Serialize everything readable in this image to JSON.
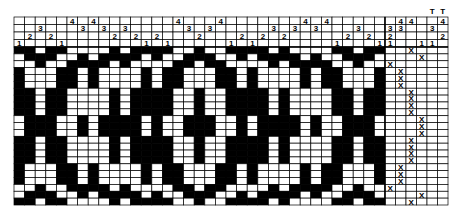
{
  "draft": {
    "title": "Weaving draft",
    "threading": [
      1,
      2,
      3,
      2,
      1,
      4,
      3,
      4,
      3,
      2,
      3,
      2,
      1,
      2,
      1,
      4,
      3,
      2,
      3,
      4,
      1,
      2,
      1,
      2,
      3,
      2,
      3,
      4,
      3,
      4,
      1,
      2,
      3,
      2,
      1
    ],
    "tieup_columns": [
      {
        "shafts": [
          1,
          2,
          3
        ],
        "label": ""
      },
      {
        "shafts": [
          3,
          4
        ],
        "label": ""
      },
      {
        "shafts": [
          4
        ],
        "label": ""
      },
      {
        "shafts": [
          1
        ],
        "label": ""
      },
      {
        "shafts": [
          1,
          3
        ],
        "label": "T"
      },
      {
        "shafts": [
          2,
          4
        ],
        "label": "T"
      }
    ],
    "treadle_black_shafts": {
      "1": [
        3,
        4
      ],
      "2": [
        1,
        4
      ],
      "3": [
        1,
        2
      ],
      "4": [
        2,
        3
      ]
    },
    "treadling": [
      3,
      4,
      1,
      2,
      2,
      2,
      3,
      3,
      3,
      3,
      4,
      4,
      4,
      3,
      3,
      3,
      3,
      2,
      2,
      2,
      1,
      4,
      3
    ],
    "treadle_mark": "X",
    "colors": {
      "filled": "#000000",
      "empty": "#ffffff",
      "line": "#000000"
    }
  }
}
